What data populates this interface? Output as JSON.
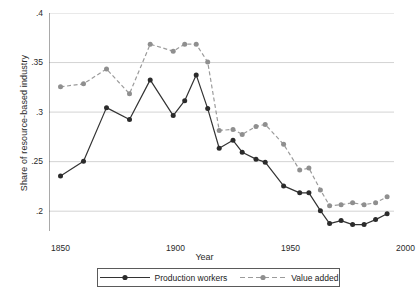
{
  "chart_data": {
    "type": "line",
    "title": "",
    "xlabel": "Year",
    "ylabel": "Share of resource-based industry",
    "xlim": [
      1845,
      1995
    ],
    "ylim": [
      0.18,
      0.4
    ],
    "xticks": [
      1850,
      1900,
      1950,
      2000
    ],
    "xticklabels": [
      "1850",
      "1900",
      "1950",
      "2000"
    ],
    "yticks": [
      0.2,
      0.25,
      0.3,
      0.35,
      0.4
    ],
    "yticklabels": [
      ".2",
      ".25",
      ".3",
      ".35",
      ".4"
    ],
    "grid": "horizontal",
    "legend_position": "below-axes",
    "series": [
      {
        "name": "Production workers",
        "color": "#333333",
        "linestyle": "solid",
        "marker": "filled-circle",
        "x": [
          1850,
          1860,
          1870,
          1880,
          1889,
          1899,
          1904,
          1909,
          1914,
          1919,
          1925,
          1929,
          1935,
          1939,
          1947,
          1954,
          1958,
          1963,
          1967,
          1972,
          1977,
          1982,
          1987,
          1992
        ],
        "values": [
          0.2355,
          0.2505,
          0.3045,
          0.2925,
          0.3325,
          0.2965,
          0.3115,
          0.3375,
          0.3035,
          0.2635,
          0.2715,
          0.2595,
          0.2525,
          0.2495,
          0.2255,
          0.2185,
          0.2185,
          0.2005,
          0.1875,
          0.1905,
          0.1865,
          0.1865,
          0.1915,
          0.1975
        ]
      },
      {
        "name": "Value added",
        "color": "#9b9b9b",
        "linestyle": "dashed",
        "marker": "filled-circle",
        "x": [
          1850,
          1860,
          1870,
          1880,
          1889,
          1899,
          1904,
          1909,
          1914,
          1919,
          1925,
          1929,
          1935,
          1939,
          1947,
          1954,
          1958,
          1963,
          1967,
          1972,
          1977,
          1982,
          1987,
          1992
        ],
        "values": [
          0.3255,
          0.3285,
          0.3435,
          0.3185,
          0.3685,
          0.3615,
          0.3685,
          0.3685,
          0.3505,
          0.2815,
          0.2825,
          0.2775,
          0.2855,
          0.2875,
          0.2675,
          0.2415,
          0.2435,
          0.2215,
          0.2055,
          0.2065,
          0.2085,
          0.2065,
          0.2085,
          0.2145
        ]
      }
    ]
  },
  "legend": {
    "entries": [
      {
        "label": "Production workers"
      },
      {
        "label": "Value added"
      }
    ]
  }
}
